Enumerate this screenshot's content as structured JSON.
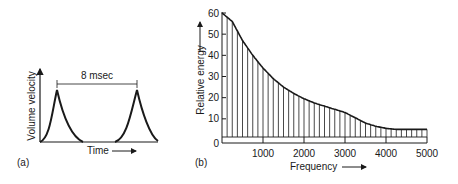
{
  "chart_data": [
    {
      "panel": "(a)",
      "type": "line",
      "title": "",
      "xlabel": "Time",
      "ylabel": "Volume velocity",
      "annotation": "8 msec",
      "description": "Periodic glottal pulses (volume velocity vs time), period 8 msec",
      "period_ms": 8,
      "pulses": 2,
      "grid": false
    },
    {
      "panel": "(b)",
      "type": "bar",
      "title": "",
      "xlabel": "Frequency",
      "ylabel": "Relative energy",
      "xlim": [
        0,
        5000
      ],
      "ylim": [
        0,
        60
      ],
      "xticks": [
        1000,
        2000,
        3000,
        4000,
        5000
      ],
      "yticks": [
        0,
        10,
        20,
        30,
        40,
        50,
        60
      ],
      "harmonic_spacing_hz": 125,
      "envelope": {
        "x": [
          0,
          250,
          500,
          750,
          1000,
          1250,
          1500,
          1750,
          2000,
          2250,
          2500,
          2750,
          3000,
          3250,
          3500,
          3750,
          4000,
          4250,
          4500,
          4750,
          5000
        ],
        "y": [
          60,
          56,
          47,
          40,
          34,
          29,
          25,
          22,
          19.5,
          17.5,
          16,
          14.5,
          13,
          10.5,
          8,
          6.5,
          5.5,
          5,
          5,
          5,
          5
        ]
      },
      "floor_level": 2,
      "grid": false
    }
  ],
  "labels": {
    "a": {
      "panel": "(a)",
      "ylabel": "Volume velocity",
      "xlabel": "Time",
      "period": "8 msec"
    },
    "b": {
      "panel": "(b)",
      "ylabel": "Relative energy",
      "xlabel": "Frequency",
      "yticks": [
        "0",
        "10",
        "20",
        "30",
        "40",
        "50",
        "60"
      ],
      "xticks": [
        "1000",
        "2000",
        "3000",
        "4000",
        "5000"
      ]
    }
  }
}
